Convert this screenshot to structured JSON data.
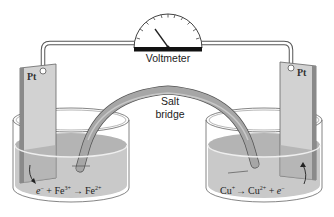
{
  "diagram": {
    "voltmeter": {
      "label": "Voltmeter"
    },
    "salt_bridge": {
      "label_line1": "Salt",
      "label_line2": "bridge"
    },
    "left_cell": {
      "electrode_label": "Pt",
      "reaction": {
        "r1": "e",
        "r1_sup": "−",
        "plus": " + ",
        "r2": "Fe",
        "r2_sup": "3+",
        "arrow": "→",
        "p1": "Fe",
        "p1_sup": "2+"
      }
    },
    "right_cell": {
      "electrode_label": "Pt",
      "reaction": {
        "r1": "Cu",
        "r1_sup": "+",
        "arrow": "→",
        "p1": "Cu",
        "p1_sup": "2+",
        "plus": " + ",
        "p2": "e",
        "p2_sup": "−"
      }
    },
    "colors": {
      "solution": "#c9c9c9",
      "solution_top": "#b4b4b4",
      "electrode": "#d2d2d2",
      "electrode_edge": "#6a6a6a",
      "bridge": "#a6a6a6",
      "wire": "#ffffff",
      "outline": "#555555",
      "meter_base": "#111111"
    }
  }
}
